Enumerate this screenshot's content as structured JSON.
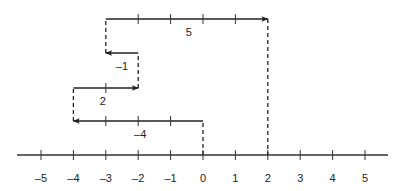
{
  "diagram": {
    "type": "number-line-vector-addition",
    "axis": {
      "min": -5,
      "max": 5,
      "tick_labels": [
        "-5",
        "-4",
        "-3",
        "-2",
        "-1",
        "0",
        "1",
        "2",
        "3",
        "4",
        "5"
      ]
    },
    "steps": [
      {
        "label": "-4",
        "start": 0,
        "end": -4
      },
      {
        "label": "2",
        "start": -4,
        "end": -2
      },
      {
        "label": "-1",
        "start": -2,
        "end": -3
      },
      {
        "label": "5",
        "start": -3,
        "end": 2
      }
    ],
    "result": 2,
    "colors": {
      "stroke": "#222222",
      "background": "#ffffff"
    }
  }
}
